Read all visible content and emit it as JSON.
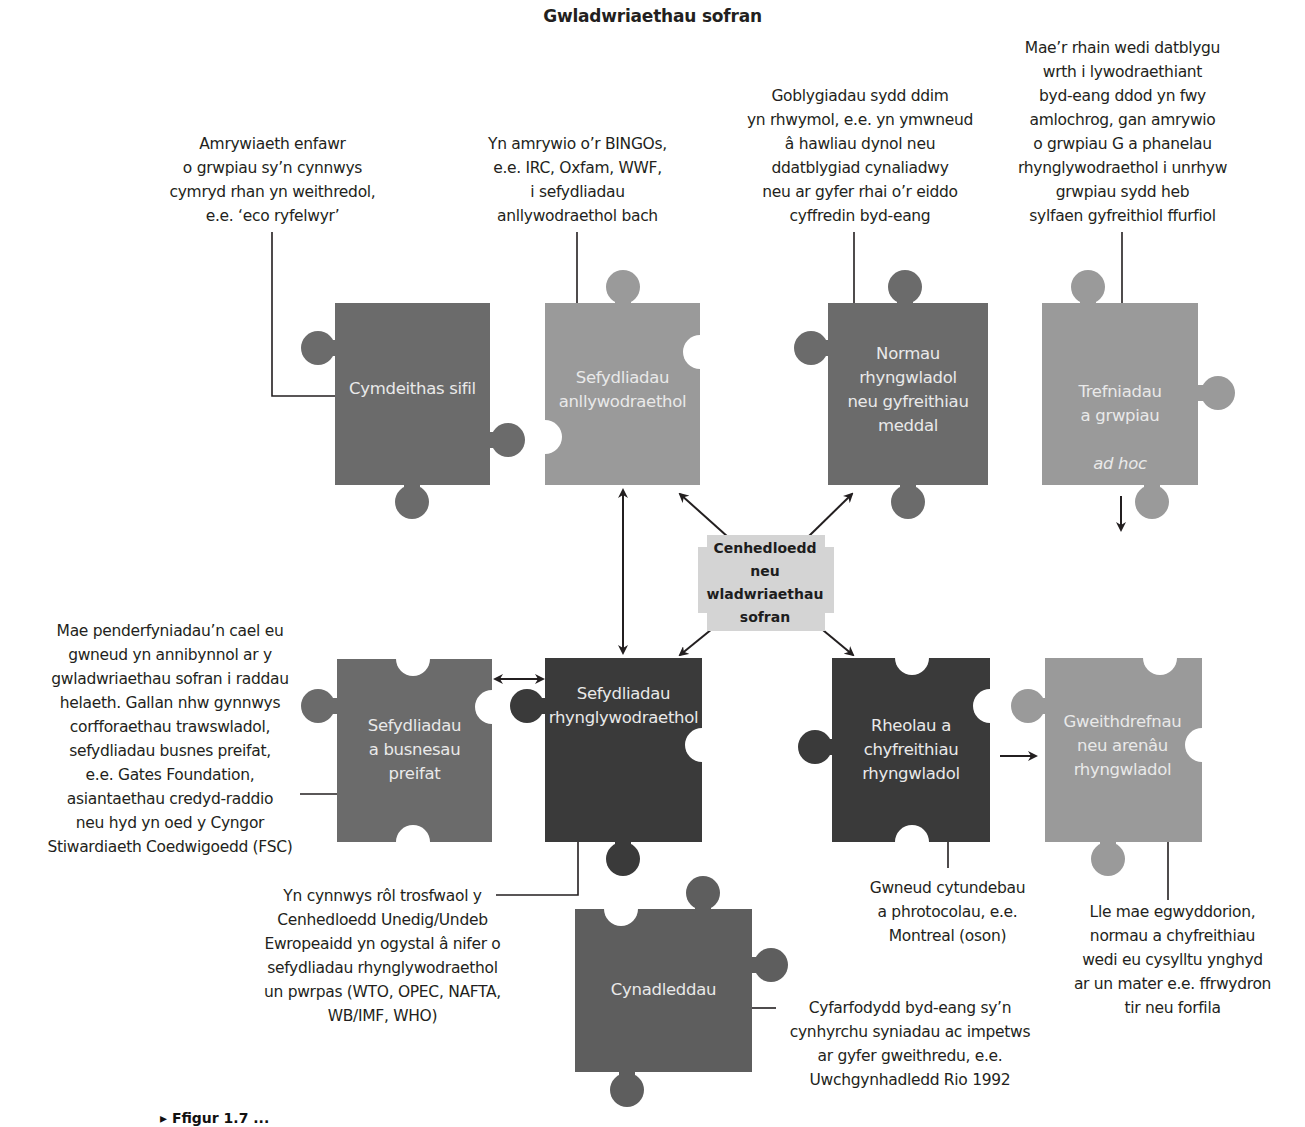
{
  "title": "Gwladwriaethau sofran",
  "center": {
    "label": "Cenhedloedd\nneu\nwladwriaethau\nsofran",
    "color": "#d4d4d4"
  },
  "colors": {
    "piece_dark": "#3a3a3a",
    "piece_mid": "#6b6b6b",
    "piece_light": "#9a9a9a",
    "piece_text": "#e9e9e9",
    "line": "#231f20"
  },
  "pieces": [
    {
      "id": "cymdeithas-sifil",
      "label": "Cymdeithas sifil",
      "shade": "mid"
    },
    {
      "id": "sefydliadau-anllywodraethol",
      "label": "Sefydliadau\nanllywodraethol",
      "shade": "light"
    },
    {
      "id": "normau-rhyngwladol",
      "label": "Normau\nrhyngwladol\nneu gyfreithiau\nmeddal",
      "shade": "mid"
    },
    {
      "id": "trefniadau-ad-hoc",
      "label_main": "Trefniadau\na grwpiau",
      "label_italic": "ad hoc",
      "shade": "light"
    },
    {
      "id": "sefydliadau-busnesau-preifat",
      "label": "Sefydliadau\na busnesau\npreifat",
      "shade": "mid"
    },
    {
      "id": "sefydliadau-rhynglywodraethol",
      "label": "Sefydliadau\nrhynglywodraethol",
      "shade": "dark"
    },
    {
      "id": "rheolau-cyfreithiau-rhyngwladol",
      "label": "Rheolau a\nchyfreithiau\nrhyngwladol",
      "shade": "dark"
    },
    {
      "id": "gweithdrefnau-arenau",
      "label": "Gweithdrefnau\nneu arenâu\nrhyngwladol",
      "shade": "light"
    },
    {
      "id": "cynadleddau",
      "label": "Cynadleddau",
      "shade": "mid"
    }
  ],
  "notes": {
    "cymdeithas_sifil": "Amrywiaeth enfawr\no grwpiau sy’n cynnwys\ncymryd rhan yn weithredol,\ne.e. ‘eco ryfelwyr’",
    "anllywodraethol": "Yn amrywio o’r BINGOs,\ne.e. IRC, Oxfam, WWF,\ni sefydliadau\nanllywodraethol bach",
    "normau": "Goblygiadau sydd ddim\nyn rhwymol, e.e. yn ymwneud\nâ hawliau dynol neu\nddatblygiad cynaliadwy\nneu ar gyfer rhai o’r eiddo\ncyffredin byd-eang",
    "trefniadau": "Mae’r rhain wedi datblygu\nwrth i lywodraethiant\nbyd-eang ddod yn fwy\namlochrog, gan amrywio\no grwpiau G a phanelau\nrhynglywodraethol i unrhyw\ngrwpiau sydd heb\nsylfaen gyfreithiol ffurfiol",
    "busnesau": "Mae penderfyniadau’n cael eu\ngwneud yn annibynnol ar y\ngwladwriaethau sofran i raddau\nhelaeth. Gallan nhw gynnwys\ncorfforaethau  trawswladol,\nsefydliadau busnes preifat,\ne.e. Gates Foundation,\nasiantaethau credyd-raddio\nneu hyd yn oed y Cyngor\nStiwardiaeth Coedwigoedd (FSC)",
    "rhynglywodraethol": "Yn cynnwys rôl trosfwaol y\nCenhedloedd Unedig/Undeb\nEwropeaidd yn ogystal â nifer o\nsefydliadau rhynglywodraethol\nun pwrpas (WTO, OPEC, NAFTA,\nWB/IMF, WHO)",
    "rheolau": "Gwneud cytundebau\na phrotocolau, e.e.\nMontreal (oson)",
    "gweithdrefnau": "Lle mae egwyddorion,\nnormau a chyfreithiau\nwedi eu cysylltu ynghyd\nar un mater e.e. ffrwydron\ntir neu forfila",
    "cynadleddau": "Cyfarfodydd byd-eang sy’n\ncynhyrchu syniadau ac impetws\nar gyfer gweithredu, e.e.\nUwchgynhadledd Rio 1992"
  },
  "caption": "▸ Ffigur 1.7 ..."
}
